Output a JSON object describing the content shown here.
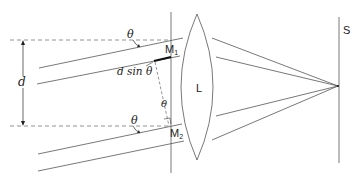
{
  "diagram": {
    "labels": {
      "theta_top": "θ",
      "theta_bottom": "θ",
      "theta_mid": "θ",
      "d": "d",
      "d_sin_theta": "d sin θ",
      "M1": "M",
      "M1_sub": "1",
      "M2": "M",
      "M2_sub": "2",
      "lens": "L",
      "screen": "S"
    },
    "colors": {
      "line": "#555555",
      "dashed": "#777777",
      "thick": "#111111",
      "text": "#222222"
    }
  }
}
